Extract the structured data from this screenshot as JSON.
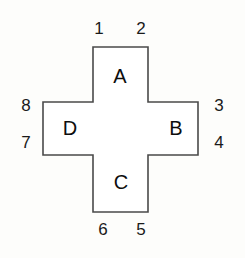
{
  "figure": {
    "title": "",
    "shape": "cross",
    "background_color": "#fdfdfb",
    "outline_color": "#4a4a4a",
    "fill_color": "#ffffff",
    "text_color": "#0d0d0d"
  },
  "arms": [
    {
      "id": "a",
      "label": "A",
      "position": "top"
    },
    {
      "id": "b",
      "label": "B",
      "position": "right"
    },
    {
      "id": "c",
      "label": "C",
      "position": "bottom"
    },
    {
      "id": "d",
      "label": "D",
      "position": "left"
    }
  ],
  "vertices": [
    {
      "id": "1",
      "label": "1",
      "position": "top-left"
    },
    {
      "id": "2",
      "label": "2",
      "position": "top-right"
    },
    {
      "id": "3",
      "label": "3",
      "position": "right-top"
    },
    {
      "id": "4",
      "label": "4",
      "position": "right-bottom"
    },
    {
      "id": "5",
      "label": "5",
      "position": "bottom-right"
    },
    {
      "id": "6",
      "label": "6",
      "position": "bottom-left"
    },
    {
      "id": "7",
      "label": "7",
      "position": "left-bottom"
    },
    {
      "id": "8",
      "label": "8",
      "position": "left-top"
    }
  ],
  "geometry": {
    "points": "93,47 148,47 148,102 198,102 198,155 148,155 148,212 93,212 93,155 43,155 43,102 93,102"
  }
}
